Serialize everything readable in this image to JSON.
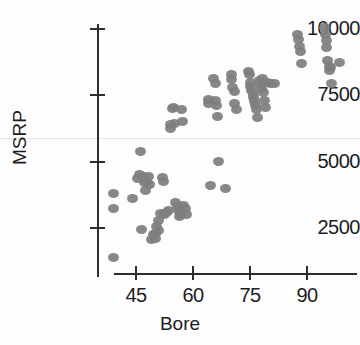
{
  "chart_data": {
    "type": "scatter",
    "title": "",
    "xlabel": "Bore",
    "ylabel": "MSRP",
    "xlim": [
      36,
      100
    ],
    "ylim": [
      1000,
      10400
    ],
    "grid": false,
    "legend": null,
    "marker_color": "#7e7e7e",
    "axis_color": "#2e2e2e",
    "xticks": [
      45,
      60,
      75,
      90
    ],
    "xtick_labels": [
      "45",
      "60",
      "75",
      "90"
    ],
    "yticks": [
      2500,
      5000,
      7500,
      10000
    ],
    "ytick_labels": [
      "2500",
      "5000",
      "7500",
      "10000"
    ],
    "points": [
      {
        "x": 39.0,
        "y": 3800
      },
      {
        "x": 39.0,
        "y": 3250
      },
      {
        "x": 39.2,
        "y": 1400
      },
      {
        "x": 44.0,
        "y": 3600
      },
      {
        "x": 45.5,
        "y": 4350
      },
      {
        "x": 45.8,
        "y": 4500
      },
      {
        "x": 46.2,
        "y": 5400
      },
      {
        "x": 47.0,
        "y": 4450
      },
      {
        "x": 47.2,
        "y": 4200
      },
      {
        "x": 47.5,
        "y": 3900
      },
      {
        "x": 47.8,
        "y": 4250
      },
      {
        "x": 46.5,
        "y": 2450
      },
      {
        "x": 48.2,
        "y": 4450
      },
      {
        "x": 48.5,
        "y": 4150
      },
      {
        "x": 49.0,
        "y": 2050
      },
      {
        "x": 49.5,
        "y": 2250
      },
      {
        "x": 50.0,
        "y": 2300
      },
      {
        "x": 50.2,
        "y": 2100
      },
      {
        "x": 50.5,
        "y": 2550
      },
      {
        "x": 50.8,
        "y": 2400
      },
      {
        "x": 51.0,
        "y": 2800
      },
      {
        "x": 51.5,
        "y": 3050
      },
      {
        "x": 52.0,
        "y": 4400
      },
      {
        "x": 52.3,
        "y": 4250
      },
      {
        "x": 52.5,
        "y": 3000
      },
      {
        "x": 53.0,
        "y": 3100
      },
      {
        "x": 53.5,
        "y": 3150
      },
      {
        "x": 54.0,
        "y": 6400
      },
      {
        "x": 54.2,
        "y": 6250
      },
      {
        "x": 54.5,
        "y": 7000
      },
      {
        "x": 54.8,
        "y": 7050
      },
      {
        "x": 55.0,
        "y": 6450
      },
      {
        "x": 55.5,
        "y": 3450
      },
      {
        "x": 56.0,
        "y": 3300
      },
      {
        "x": 56.2,
        "y": 3150
      },
      {
        "x": 56.5,
        "y": 2950
      },
      {
        "x": 56.8,
        "y": 3000
      },
      {
        "x": 57.0,
        "y": 6950
      },
      {
        "x": 57.2,
        "y": 6500
      },
      {
        "x": 57.5,
        "y": 3350
      },
      {
        "x": 58.0,
        "y": 3250
      },
      {
        "x": 58.2,
        "y": 3000
      },
      {
        "x": 64.0,
        "y": 7350
      },
      {
        "x": 64.2,
        "y": 7200
      },
      {
        "x": 64.5,
        "y": 4100
      },
      {
        "x": 65.5,
        "y": 8150
      },
      {
        "x": 65.8,
        "y": 7950
      },
      {
        "x": 66.0,
        "y": 7300
      },
      {
        "x": 66.2,
        "y": 7100
      },
      {
        "x": 66.5,
        "y": 6700
      },
      {
        "x": 66.8,
        "y": 5000
      },
      {
        "x": 68.5,
        "y": 4000
      },
      {
        "x": 70.0,
        "y": 8300
      },
      {
        "x": 70.2,
        "y": 8100
      },
      {
        "x": 70.5,
        "y": 7800
      },
      {
        "x": 70.8,
        "y": 7650
      },
      {
        "x": 71.0,
        "y": 7200
      },
      {
        "x": 71.5,
        "y": 6950
      },
      {
        "x": 74.5,
        "y": 8400
      },
      {
        "x": 74.8,
        "y": 8300
      },
      {
        "x": 75.0,
        "y": 8000
      },
      {
        "x": 75.2,
        "y": 7850
      },
      {
        "x": 75.5,
        "y": 7700
      },
      {
        "x": 75.8,
        "y": 7550
      },
      {
        "x": 76.0,
        "y": 7400
      },
      {
        "x": 76.2,
        "y": 7250
      },
      {
        "x": 76.5,
        "y": 7100
      },
      {
        "x": 76.8,
        "y": 6950
      },
      {
        "x": 77.0,
        "y": 6650
      },
      {
        "x": 77.5,
        "y": 8050
      },
      {
        "x": 77.8,
        "y": 7900
      },
      {
        "x": 78.0,
        "y": 7750
      },
      {
        "x": 78.2,
        "y": 8150
      },
      {
        "x": 78.5,
        "y": 7600
      },
      {
        "x": 78.8,
        "y": 7300
      },
      {
        "x": 79.0,
        "y": 7050
      },
      {
        "x": 79.5,
        "y": 8000
      },
      {
        "x": 80.5,
        "y": 7950
      },
      {
        "x": 81.5,
        "y": 7950
      },
      {
        "x": 87.5,
        "y": 9800
      },
      {
        "x": 87.8,
        "y": 9600
      },
      {
        "x": 88.0,
        "y": 9350
      },
      {
        "x": 88.2,
        "y": 9150
      },
      {
        "x": 88.5,
        "y": 8700
      },
      {
        "x": 94.5,
        "y": 10050
      },
      {
        "x": 94.8,
        "y": 9800
      },
      {
        "x": 95.0,
        "y": 9550
      },
      {
        "x": 95.2,
        "y": 9300
      },
      {
        "x": 95.5,
        "y": 8800
      },
      {
        "x": 95.8,
        "y": 8600
      },
      {
        "x": 96.0,
        "y": 8450
      },
      {
        "x": 96.2,
        "y": 8550
      },
      {
        "x": 96.5,
        "y": 7950
      },
      {
        "x": 98.5,
        "y": 8750
      }
    ]
  }
}
